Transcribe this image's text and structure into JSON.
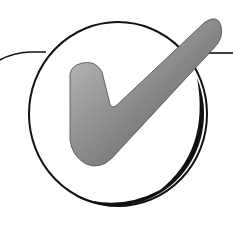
{
  "figure": {
    "icon": "checkmark-in-circle-icon",
    "colors": {
      "background": "#ffffff",
      "outline": "#111111",
      "check_light": "#bdbdbd",
      "check_dark": "#5a5a5a"
    }
  }
}
